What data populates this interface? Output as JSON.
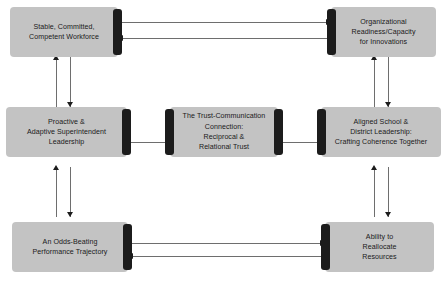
{
  "diagram": {
    "title": "",
    "colors": {
      "node_fill": "#c3c3c3",
      "node_shadow": "#1c1c1c",
      "connector": "#6e6e6e",
      "arrowhead": "#1c1c1c",
      "background": "#ffffff",
      "text": "#1a1a1a"
    },
    "nodes": [
      {
        "id": "workforce",
        "label": "Stable, Committed,\nCompetent Workforce",
        "line1": "Stable, Committed,",
        "line2": "Competent Workforce",
        "position": "top-left",
        "shadow_side": "right"
      },
      {
        "id": "org-readiness",
        "label": "Organizational\nReadiness/Capacity\nfor Innovations",
        "line1": "Organizational",
        "line2": "Readiness/Capacity",
        "line3": "for Innovations",
        "position": "top-right",
        "shadow_side": "left"
      },
      {
        "id": "superintendent-leadership",
        "label": "Proactive &\nAdaptive Superintendent\nLeadership",
        "line1": "Proactive &",
        "line2": "Adaptive Superintendent",
        "line3": "Leadership",
        "position": "middle-left",
        "shadow_side": "right"
      },
      {
        "id": "trust-communication",
        "label": "The Trust-Communication\nConnection:\nReciprocal &\nRelational Trust",
        "line1": "The Trust-Communication",
        "line2": "Connection:",
        "line3": "Reciprocal &",
        "line4": "Relational Trust",
        "position": "center",
        "shadow_side": "both"
      },
      {
        "id": "aligned-leadership",
        "label": "Aligned School &\nDistrict Leadership:\nCrafting Coherence Together",
        "line1": "Aligned School &",
        "line2": "District Leadership:",
        "line3": "Crafting Coherence Together",
        "position": "middle-right",
        "shadow_side": "left"
      },
      {
        "id": "performance-trajectory",
        "label": "An Odds-Beating\nPerformance Trajectory",
        "line1": "An Odds-Beating",
        "line2": "Performance Trajectory",
        "position": "bottom-left",
        "shadow_side": "right"
      },
      {
        "id": "reallocate-resources",
        "label": "Ability to\nReallocate\nResources",
        "line1": "Ability to",
        "line2": "Reallocate",
        "line3": "Resources",
        "position": "bottom-right",
        "shadow_side": "left"
      }
    ],
    "connectors": [
      {
        "id": "workforce-to-org",
        "from": "workforce",
        "to": "org-readiness",
        "style": "bidirectional-double",
        "orientation": "horizontal"
      },
      {
        "id": "workforce-to-superintendent",
        "from": "workforce",
        "to": "superintendent-leadership",
        "style": "bidirectional-double",
        "orientation": "vertical"
      },
      {
        "id": "org-to-aligned",
        "from": "org-readiness",
        "to": "aligned-leadership",
        "style": "bidirectional-double",
        "orientation": "vertical"
      },
      {
        "id": "superintendent-to-trust",
        "from": "superintendent-leadership",
        "to": "trust-communication",
        "style": "plain-line",
        "orientation": "horizontal"
      },
      {
        "id": "trust-to-aligned",
        "from": "trust-communication",
        "to": "aligned-leadership",
        "style": "plain-line",
        "orientation": "horizontal"
      },
      {
        "id": "superintendent-to-performance",
        "from": "superintendent-leadership",
        "to": "performance-trajectory",
        "style": "bidirectional-double",
        "orientation": "vertical"
      },
      {
        "id": "aligned-to-resources",
        "from": "aligned-leadership",
        "to": "reallocate-resources",
        "style": "bidirectional-double",
        "orientation": "vertical"
      },
      {
        "id": "performance-to-resources",
        "from": "performance-trajectory",
        "to": "reallocate-resources",
        "style": "bidirectional-double",
        "orientation": "horizontal"
      }
    ]
  }
}
